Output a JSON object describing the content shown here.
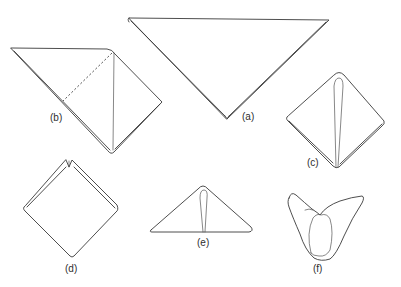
{
  "diagram": {
    "type": "folding-sequence",
    "stroke_color": "#3a3a3a",
    "background": "#ffffff",
    "figures": [
      {
        "id": "a",
        "label": "(a)",
        "shape": "large inverted triangle (sheet folded in half diagonally)"
      },
      {
        "id": "b",
        "label": "(b)",
        "shape": "triangle with corner folded over, vertical crease and dashed fold line"
      },
      {
        "id": "c",
        "label": "(c)",
        "shape": "diamond with narrow central loop"
      },
      {
        "id": "d",
        "label": "(d)",
        "shape": "diamond with notched top"
      },
      {
        "id": "e",
        "label": "(e)",
        "shape": "flat triangle with central loop"
      },
      {
        "id": "f",
        "label": "(f)",
        "shape": "opened cup shape with central loop"
      }
    ]
  }
}
